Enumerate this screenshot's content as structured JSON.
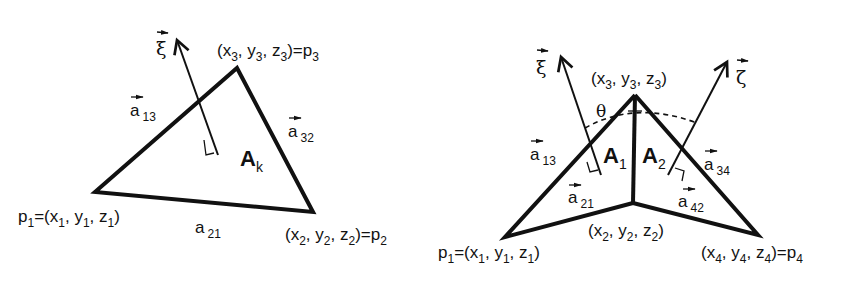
{
  "left_figure": {
    "title": "Single triangle element",
    "area_label": {
      "main": "A",
      "sub": "k"
    },
    "normal_label": "ξ",
    "vertices": {
      "p1": {
        "text": "p1=(x1, y1, z1)"
      },
      "p2": {
        "text": "(x2, y2, z2)=p2"
      },
      "p3": {
        "text": "(x3, y3, z3)=p3"
      }
    },
    "edges": {
      "a13": {
        "main": "a",
        "sub": "13"
      },
      "a32": {
        "main": "a",
        "sub": "32"
      },
      "a21": {
        "main": "a",
        "sub": "21"
      }
    }
  },
  "right_figure": {
    "title": "Two adjacent triangles sharing an edge",
    "area_labels": [
      {
        "main": "A",
        "sub": "1"
      },
      {
        "main": "A",
        "sub": "2"
      }
    ],
    "normal_labels": {
      "xi": "ξ",
      "zeta": "ζ"
    },
    "angle_label": "θ",
    "vertices": {
      "p1": {
        "text": "p1=(x1, y1, z1)"
      },
      "p2": {
        "text": "(x2, y2, z2)"
      },
      "p3": {
        "text": "(x3, y3, z3)"
      },
      "p4": {
        "text": "(x4, y4, z4)=p4"
      }
    },
    "edges": {
      "a13": {
        "main": "a",
        "sub": "13"
      },
      "a21": {
        "main": "a",
        "sub": "21"
      },
      "a42": {
        "main": "a",
        "sub": "42"
      },
      "a34": {
        "main": "a",
        "sub": "34"
      }
    }
  },
  "sub": {
    "1": "1",
    "2": "2",
    "3": "3",
    "4": "4"
  },
  "sym": {
    "p": "p",
    "x": "x",
    "y": "y",
    "z": "z",
    "eq": "=",
    "open": "(",
    "close": ")",
    "comma": ", "
  }
}
